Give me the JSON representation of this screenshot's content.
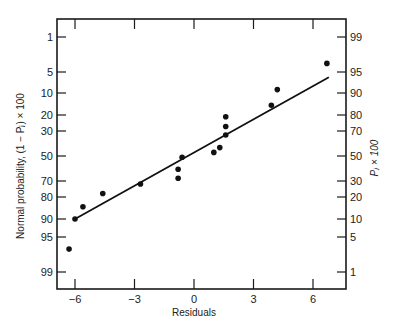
{
  "chart_data": {
    "type": "scatter",
    "title": "",
    "xlabel": "Residuals",
    "ylabel_left": "Normal probability, (1 − Pⱼ) × 100",
    "ylabel_right": "Pⱼ × 100",
    "xlim": [
      -7,
      8.5
    ],
    "x_ticks": [
      -6,
      -3,
      0,
      3,
      6
    ],
    "x_tick_labels": [
      "−6",
      "−3",
      "0",
      "3",
      "6"
    ],
    "y_left_ticks": [
      1,
      5,
      10,
      20,
      30,
      50,
      70,
      80,
      90,
      95,
      99
    ],
    "y_right_ticks": [
      99,
      95,
      90,
      80,
      70,
      50,
      30,
      20,
      10,
      5,
      1
    ],
    "y_scale": "normal-probability",
    "grid": false,
    "legend": null,
    "points": [
      {
        "x": -6.3,
        "y": 97
      },
      {
        "x": -6.0,
        "y": 90
      },
      {
        "x": -5.6,
        "y": 85
      },
      {
        "x": -4.6,
        "y": 78
      },
      {
        "x": -2.7,
        "y": 72
      },
      {
        "x": -0.8,
        "y": 68
      },
      {
        "x": -0.8,
        "y": 61
      },
      {
        "x": -0.6,
        "y": 51
      },
      {
        "x": 1.0,
        "y": 47
      },
      {
        "x": 1.3,
        "y": 43
      },
      {
        "x": 1.6,
        "y": 33
      },
      {
        "x": 1.6,
        "y": 27
      },
      {
        "x": 1.6,
        "y": 21
      },
      {
        "x": 3.9,
        "y": 15
      },
      {
        "x": 4.2,
        "y": 9
      },
      {
        "x": 6.7,
        "y": 3.5
      }
    ],
    "fit_line": {
      "x": [
        -6.0,
        6.8
      ],
      "y": [
        90,
        6
      ]
    }
  },
  "layout": {
    "plot": {
      "left": 57,
      "top": 19,
      "right": 346,
      "bottom": 289
    },
    "x_pixel": {
      "-6": 75,
      "-3": 135,
      "0": 194,
      "3": 254,
      "6": 313
    },
    "y_left_pixel": {
      "1": 37,
      "5": 72,
      "10": 93,
      "20": 115,
      "30": 131,
      "50": 156,
      "70": 181,
      "80": 197,
      "90": 219,
      "95": 237,
      "99": 272
    }
  }
}
